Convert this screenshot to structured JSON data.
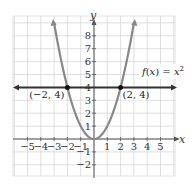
{
  "chart_data": {
    "type": "line",
    "title": "",
    "xlabel": "x",
    "ylabel": "y",
    "xlim": [
      -6,
      6
    ],
    "ylim": [
      -3,
      9
    ],
    "grid": true,
    "x_ticks": [
      "-5",
      "-4",
      "-3",
      "-2",
      "-1",
      "1",
      "2",
      "3",
      "4",
      "5"
    ],
    "y_ticks": [
      "8",
      "7",
      "6",
      "5",
      "4",
      "3",
      "2",
      "1",
      "-1",
      "-2"
    ],
    "series": [
      {
        "name": "f(x) = x²",
        "function": "x^2",
        "color": "#888888",
        "x": [
          -3,
          -2,
          -1,
          0,
          1,
          2,
          3
        ],
        "values": [
          9,
          4,
          1,
          0,
          1,
          4,
          9
        ]
      },
      {
        "name": "y = 4",
        "function": "4",
        "color": "#333333",
        "x": [
          -6,
          6
        ],
        "values": [
          4,
          4
        ]
      }
    ],
    "points": [
      {
        "label": "(−2, 4)",
        "x": -2,
        "y": 4
      },
      {
        "label": "(2, 4)",
        "x": 2,
        "y": 4
      }
    ],
    "annotations": [
      {
        "text": "f(x) = x²",
        "x": 4.8,
        "y": 5.2
      }
    ]
  }
}
